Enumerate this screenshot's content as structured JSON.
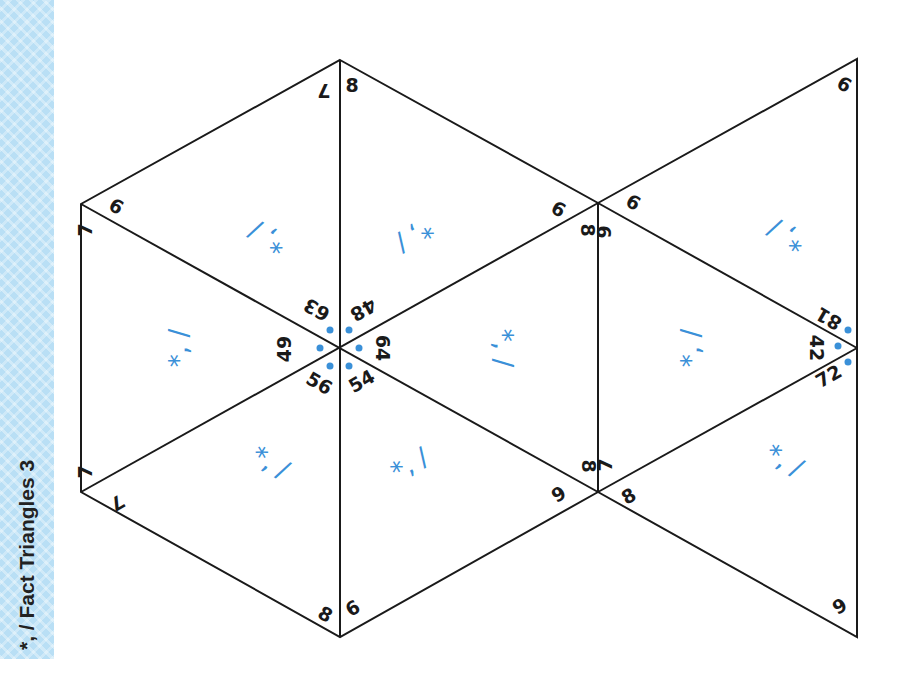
{
  "sidebar": {
    "title": "*, / Fact Triangles 3",
    "color": "#b9dff5"
  },
  "colors": {
    "line": "#1a1a1a",
    "operation": "#3a90d8",
    "dot": "#3a90d8"
  },
  "hexagon": {
    "center_products": [
      "63",
      "48",
      "64",
      "54",
      "56",
      "49"
    ],
    "outer_factors": {
      "top_left_edge": [
        "7",
        "8"
      ],
      "upper_left": [
        "6",
        "7"
      ],
      "upper_right": [
        "9",
        "8"
      ],
      "lower_left": [
        "7",
        "7"
      ],
      "lower_right": [
        "8",
        "9"
      ],
      "bottom_edge": [
        "8",
        "6"
      ]
    }
  },
  "right_group": {
    "center_products": [
      "81",
      "42",
      "72"
    ],
    "factors": {
      "top_vertex": "6",
      "upper_joint": [
        "6",
        "9"
      ],
      "lower_joint": [
        "7",
        "8"
      ],
      "bottom_vertex": "9"
    }
  },
  "operation_label": "*, /",
  "triangles": [
    {
      "id": "hex-top-left",
      "ops": "*, /"
    },
    {
      "id": "hex-top-right",
      "ops": "*, /"
    },
    {
      "id": "hex-left",
      "ops": "*, /"
    },
    {
      "id": "hex-right",
      "ops": "*, /"
    },
    {
      "id": "hex-bottom-left",
      "ops": "*, /"
    },
    {
      "id": "hex-bottom-right",
      "ops": "*, /"
    },
    {
      "id": "right-top",
      "ops": "*, /"
    },
    {
      "id": "right-middle",
      "ops": "*, /"
    },
    {
      "id": "right-bottom",
      "ops": "*, /"
    }
  ],
  "labels": {
    "hl_top_7": "7",
    "hl_top_8": "8",
    "ul_6": "6",
    "ul_7": "7",
    "ur_9": "9",
    "ur_8": "8",
    "ll_7a": "7",
    "ll_7b": "7",
    "lr_8": "8",
    "lr_9": "9",
    "b_8": "8",
    "b_6": "6",
    "c_63": "63",
    "c_48": "48",
    "c_64": "64",
    "c_54": "54",
    "c_56": "56",
    "c_49": "49",
    "r_top_6": "6",
    "r_up_6": "6",
    "r_up_9": "9",
    "r_81": "81",
    "r_42": "42",
    "r_72": "72",
    "r_lo_7": "7",
    "r_lo_8": "8",
    "r_bot_9": "9"
  }
}
